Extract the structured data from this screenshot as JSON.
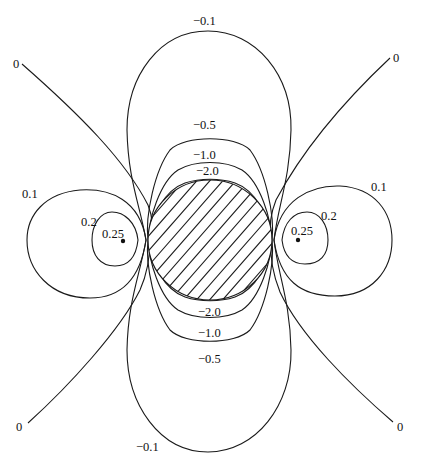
{
  "figure": {
    "header_fragment": "…",
    "labels": {
      "top_outer": "−0.1",
      "top_mid": "−0.5",
      "top_inner": "−1.0",
      "top_core": "−2.0",
      "bottom_core": "−2.0",
      "bottom_inner": "−1.0",
      "bottom_mid": "−0.5",
      "bottom_outer": "−0.1",
      "left_outer": "0.1",
      "left_mid": "0.2",
      "left_core": "0.25",
      "right_outer": "0.1",
      "right_mid": "0.2",
      "right_core": "0.25",
      "zero_top_left": "0",
      "zero_top_right": "0",
      "zero_bottom_left": "0",
      "zero_bottom_right": "0"
    },
    "contour_levels": {
      "negative": [
        -0.1,
        -0.5,
        -1.0,
        -2.0
      ],
      "positive": [
        0.1,
        0.2,
        0.25
      ],
      "zero": 0
    },
    "colors": {
      "line": "#1a1a1a",
      "background": "#ffffff"
    }
  }
}
